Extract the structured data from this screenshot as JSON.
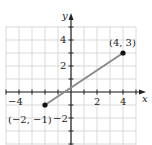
{
  "chart_data": {
    "type": "line",
    "title": "",
    "xlabel": "x",
    "ylabel": "y",
    "xlim": [
      -5,
      5
    ],
    "ylim": [
      -4,
      5
    ],
    "grid": true,
    "x_tick_labels": [
      "−4",
      "2",
      "4"
    ],
    "x_tick_values": [
      -4,
      2,
      4
    ],
    "y_tick_labels": [
      "4",
      "2",
      "−2"
    ],
    "y_tick_values": [
      4,
      2,
      -2
    ],
    "series": [
      {
        "name": "segment",
        "points": [
          {
            "x": -2,
            "y": -1
          },
          {
            "x": 4,
            "y": 3
          }
        ],
        "color": "#8a8a8a"
      }
    ],
    "annotations": [
      {
        "text": "(4, 3)",
        "x": 4,
        "y": 3
      },
      {
        "text": "(−2, −1)",
        "x": -2,
        "y": -1
      }
    ]
  },
  "colors": {
    "grid": "#d9d9d9",
    "axis": "#222222",
    "segment": "#8a8a8a",
    "point": "#111111"
  }
}
